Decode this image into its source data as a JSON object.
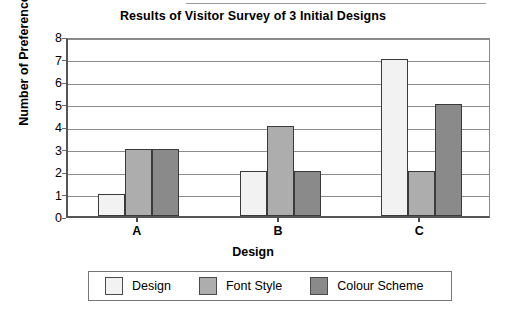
{
  "chart_data": {
    "type": "bar",
    "title": "Results of Visitor Survey of 3 Initial Designs",
    "xlabel": "Design",
    "ylabel": "Number of Preferences",
    "categories": [
      "A",
      "B",
      "C"
    ],
    "series": [
      {
        "name": "Design",
        "values": [
          1,
          2,
          7
        ],
        "color": "#f2f2f2"
      },
      {
        "name": "Font Style",
        "values": [
          3,
          4,
          2
        ],
        "color": "#adadad"
      },
      {
        "name": "Colour Scheme",
        "values": [
          3,
          2,
          5
        ],
        "color": "#8a8a8a"
      }
    ],
    "ylim": [
      0,
      8
    ],
    "ytick_labels": [
      "0",
      "1",
      "2",
      "3",
      "4",
      "5",
      "6",
      "7",
      "8"
    ],
    "grid": true,
    "legend_position": "bottom"
  }
}
